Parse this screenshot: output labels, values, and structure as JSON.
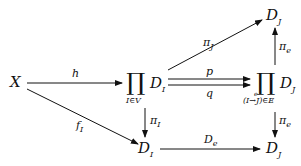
{
  "diagram": {
    "type": "commutative-diagram",
    "nodes": {
      "X": "X",
      "prodI": {
        "symbol": "∏",
        "term": "D",
        "sub": "I",
        "index": "I∈V"
      },
      "prodJ": {
        "symbol": "∏",
        "term": "D",
        "sub": "J",
        "index": "(I→J)∈E",
        "arrow_label": "e"
      },
      "DJ_top": {
        "term": "D",
        "sub": "J"
      },
      "DI_bottom": {
        "term": "D",
        "sub": "I"
      },
      "DJ_bottom": {
        "term": "D",
        "sub": "J"
      }
    },
    "arrows": {
      "h": "h",
      "fI": {
        "main": "f",
        "sub": "I"
      },
      "piJ": {
        "main": "π",
        "sub": "J"
      },
      "p": "p",
      "q": "q",
      "piI": {
        "main": "π",
        "sub": "I"
      },
      "pie_up": {
        "main": "π",
        "sub": "e"
      },
      "pie_down": {
        "main": "π",
        "sub": "e"
      },
      "De": {
        "main": "D",
        "sub": "e"
      }
    }
  }
}
